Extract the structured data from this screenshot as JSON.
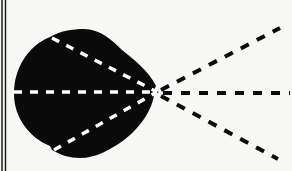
{
  "diagram": {
    "colors": {
      "background": "#f7f7f5",
      "blob": "#0a0a0a",
      "inner_dash": "#ffffff",
      "outer_dash": "#0a0a0a",
      "border": "#1a1a1a"
    },
    "focal_point": {
      "x": 157,
      "y": 92
    },
    "inner_rays": [
      {
        "from": [
          50,
          37
        ],
        "to": [
          157,
          92
        ]
      },
      {
        "from": [
          14,
          92
        ],
        "to": [
          157,
          92
        ]
      },
      {
        "from": [
          52,
          150
        ],
        "to": [
          157,
          92
        ]
      }
    ],
    "outer_rays": [
      {
        "from": [
          157,
          92
        ],
        "to": [
          280,
          28
        ]
      },
      {
        "from": [
          157,
          92
        ],
        "to": [
          290,
          93
        ]
      },
      {
        "from": [
          157,
          92
        ],
        "to": [
          278,
          159
        ]
      }
    ]
  }
}
